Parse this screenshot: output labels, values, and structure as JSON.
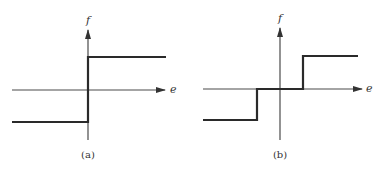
{
  "panels": [
    {
      "id": "a",
      "caption": "(a)",
      "y_axis_label": "f",
      "x_axis_label": "e",
      "description": "ideal relay (sign) nonlinearity: f = -M for e<0, f = +M for e>0"
    },
    {
      "id": "b",
      "caption": "(b)",
      "y_axis_label": "f",
      "x_axis_label": "e",
      "description": "relay with dead zone: f = -M for e<-d, 0 for |e|<d, +M for e>d"
    }
  ],
  "colors": {
    "axis": "#4a4a4a",
    "curve": "#2a2a2a",
    "background": "#ffffff"
  }
}
